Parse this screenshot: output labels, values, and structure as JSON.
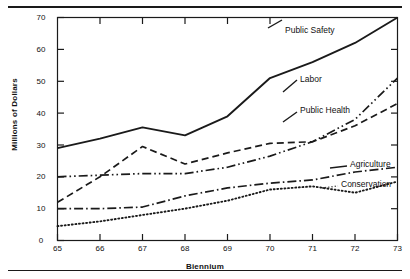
{
  "chart_data": {
    "type": "line",
    "title": "",
    "xlabel": "Biennium",
    "ylabel": "Millions of Dollars",
    "x": [
      65,
      66,
      67,
      68,
      69,
      70,
      71,
      72,
      73
    ],
    "xtick_labels": [
      "65",
      "66",
      "67",
      "68",
      "69",
      "70",
      "71",
      "72",
      "73"
    ],
    "ytick_labels": [
      "0",
      "10",
      "20",
      "30",
      "40",
      "50",
      "60",
      "70"
    ],
    "xlim": [
      65,
      73
    ],
    "ylim": [
      0,
      70
    ],
    "grid": false,
    "legend": "inline-right-labels",
    "series": [
      {
        "name": "Public Safety",
        "style": "solid",
        "values": [
          29,
          32,
          35.5,
          33,
          39,
          51,
          56,
          62,
          70
        ]
      },
      {
        "name": "Labor",
        "style": "dash-dot-dot",
        "values": [
          20,
          20.5,
          21,
          21,
          23,
          26.5,
          31,
          38,
          51
        ]
      },
      {
        "name": "Public Health",
        "style": "dashed",
        "values": [
          12,
          20,
          29.5,
          24,
          27.5,
          30.5,
          31,
          36,
          43
        ]
      },
      {
        "name": "Agriculture",
        "style": "dash-dot",
        "values": [
          10,
          10,
          10.5,
          14,
          16.5,
          18,
          19,
          21.5,
          23
        ]
      },
      {
        "name": "Conservation",
        "style": "dotted",
        "values": [
          4.5,
          6,
          8,
          10,
          12.5,
          16,
          17,
          15,
          18.5
        ]
      }
    ]
  },
  "labels": {
    "public_safety": "Public Safety",
    "labor": "Labor",
    "public_health": "Public Health",
    "agriculture": "Agriculture",
    "conservation": "Conservation"
  },
  "axes": {
    "y_title": "Millions of Dollars",
    "x_title": "Biennium",
    "y_0": "0",
    "y_10": "10",
    "y_20": "20",
    "y_30": "30",
    "y_40": "40",
    "y_50": "50",
    "y_60": "60",
    "y_70": "70",
    "x_65": "65",
    "x_66": "66",
    "x_67": "67",
    "x_68": "68",
    "x_69": "69",
    "x_70": "70",
    "x_71": "71",
    "x_72": "72",
    "x_73": "73"
  },
  "colors": {
    "ink": "#1a1a1a",
    "background": "#ffffff"
  }
}
